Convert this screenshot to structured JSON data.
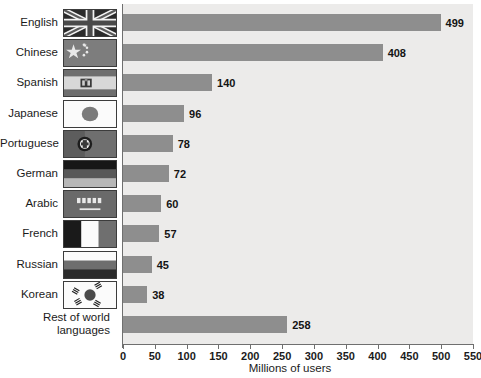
{
  "chart_data": {
    "type": "bar",
    "orientation": "horizontal",
    "title": "",
    "xlabel": "Millions of users",
    "ylabel": "",
    "xlim": [
      0,
      550
    ],
    "xticks": [
      0,
      50,
      100,
      150,
      200,
      250,
      300,
      350,
      400,
      450,
      500,
      550
    ],
    "grid": false,
    "legend": null,
    "categories": [
      "English",
      "Chinese",
      "Spanish",
      "Japanese",
      "Portuguese",
      "German",
      "Arabic",
      "French",
      "Russian",
      "Korean",
      "Rest of world languages"
    ],
    "values": [
      499,
      408,
      140,
      96,
      78,
      72,
      60,
      57,
      45,
      38,
      258
    ],
    "value_labels": [
      "499",
      "408",
      "140",
      "96",
      "78",
      "72",
      "60",
      "57",
      "45",
      "38",
      "258"
    ],
    "bar_color": "#8e8e8e",
    "plot_background": "#ecebea",
    "axis_color": "#6f6f6f"
  },
  "axis": {
    "xlabel": "Millions of users",
    "tick_labels": [
      "0",
      "50",
      "100",
      "150",
      "200",
      "250",
      "300",
      "350",
      "400",
      "450",
      "500",
      "550"
    ]
  },
  "rows": [
    {
      "label": "English",
      "value_label": "499",
      "flag": "flag-united-kingdom"
    },
    {
      "label": "Chinese",
      "value_label": "408",
      "flag": "flag-china"
    },
    {
      "label": "Spanish",
      "value_label": "140",
      "flag": "flag-spain"
    },
    {
      "label": "Japanese",
      "value_label": "96",
      "flag": "flag-japan"
    },
    {
      "label": "Portuguese",
      "value_label": "78",
      "flag": "flag-portugal"
    },
    {
      "label": "German",
      "value_label": "72",
      "flag": "flag-germany"
    },
    {
      "label": "Arabic",
      "value_label": "60",
      "flag": "flag-egypt"
    },
    {
      "label": "French",
      "value_label": "57",
      "flag": "flag-france"
    },
    {
      "label": "Russian",
      "value_label": "45",
      "flag": "flag-russia"
    },
    {
      "label": "Korean",
      "value_label": "38",
      "flag": "flag-south-korea"
    },
    {
      "label": "Rest of world languages",
      "value_label": "258",
      "flag": null
    }
  ]
}
